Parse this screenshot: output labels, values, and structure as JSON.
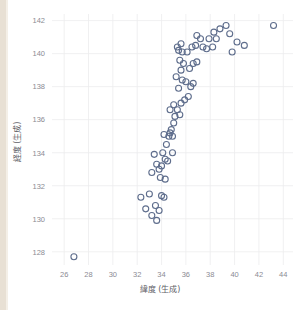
{
  "clipped_header_text": "",
  "colors": {
    "marker_stroke": "#5e6d8c",
    "gridline": "#ececed",
    "tick_text": "#8b8b93",
    "axis_title": "#5e5e66",
    "left_strip": "#e8e0d4",
    "background": "#ffffff"
  },
  "chart_data": {
    "type": "scatter",
    "title": "",
    "xlabel": "緯度 (生成)",
    "ylabel": "経度 (生成)",
    "xlim": [
      25.0,
      44.8
    ],
    "ylim": [
      127.2,
      142.4
    ],
    "xticks": [
      26,
      28,
      30,
      32,
      34,
      36,
      38,
      40,
      42,
      44
    ],
    "yticks": [
      128,
      130,
      132,
      134,
      136,
      138,
      140,
      142
    ],
    "grid": true,
    "legend": null,
    "marker": {
      "style": "open-circle",
      "radius": 3.0,
      "stroke": "#5e6d8c",
      "fill": "none"
    },
    "series": [
      {
        "name": "生成データ",
        "points": [
          [
            26.8,
            127.7
          ],
          [
            32.3,
            131.3
          ],
          [
            32.7,
            130.6
          ],
          [
            33.0,
            131.5
          ],
          [
            33.2,
            130.2
          ],
          [
            33.5,
            130.8
          ],
          [
            33.6,
            129.9
          ],
          [
            33.8,
            130.5
          ],
          [
            34.0,
            131.4
          ],
          [
            34.2,
            131.3
          ],
          [
            33.2,
            132.8
          ],
          [
            33.6,
            133.3
          ],
          [
            33.8,
            133.0
          ],
          [
            34.0,
            133.2
          ],
          [
            33.4,
            133.9
          ],
          [
            34.1,
            134.0
          ],
          [
            34.3,
            133.6
          ],
          [
            34.5,
            133.5
          ],
          [
            34.4,
            134.5
          ],
          [
            34.6,
            135.0
          ],
          [
            34.7,
            135.2
          ],
          [
            34.8,
            135.4
          ],
          [
            34.9,
            135.0
          ],
          [
            34.2,
            135.1
          ],
          [
            35.0,
            135.8
          ],
          [
            35.1,
            136.2
          ],
          [
            35.3,
            136.6
          ],
          [
            35.0,
            136.9
          ],
          [
            34.7,
            136.6
          ],
          [
            35.5,
            136.3
          ],
          [
            35.6,
            137.0
          ],
          [
            35.9,
            137.2
          ],
          [
            36.2,
            137.4
          ],
          [
            35.4,
            137.9
          ],
          [
            35.7,
            138.4
          ],
          [
            36.0,
            138.3
          ],
          [
            36.4,
            138.0
          ],
          [
            35.2,
            138.6
          ],
          [
            35.6,
            139.0
          ],
          [
            35.8,
            139.4
          ],
          [
            35.5,
            139.6
          ],
          [
            36.3,
            139.1
          ],
          [
            36.6,
            139.4
          ],
          [
            36.9,
            139.5
          ],
          [
            35.4,
            140.2
          ],
          [
            35.7,
            140.1
          ],
          [
            36.1,
            140.1
          ],
          [
            36.5,
            140.4
          ],
          [
            35.3,
            140.4
          ],
          [
            35.6,
            140.6
          ],
          [
            36.8,
            140.5
          ],
          [
            37.4,
            140.4
          ],
          [
            37.7,
            140.3
          ],
          [
            38.2,
            140.4
          ],
          [
            37.9,
            140.9
          ],
          [
            38.5,
            140.9
          ],
          [
            38.3,
            141.3
          ],
          [
            37.2,
            140.9
          ],
          [
            36.9,
            141.1
          ],
          [
            39.6,
            141.2
          ],
          [
            39.8,
            140.1
          ],
          [
            40.2,
            140.7
          ],
          [
            40.8,
            140.5
          ],
          [
            38.8,
            141.5
          ],
          [
            39.3,
            141.7
          ],
          [
            43.2,
            141.7
          ],
          [
            36.6,
            138.2
          ],
          [
            34.9,
            134.0
          ],
          [
            33.9,
            132.5
          ],
          [
            34.3,
            132.4
          ]
        ]
      }
    ]
  }
}
